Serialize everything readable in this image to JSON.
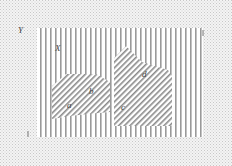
{
  "diagram": {
    "outer_label": "Y",
    "inner_label": "X",
    "region_labels": {
      "a": "a",
      "b": "b",
      "c": "c",
      "d": "d"
    },
    "tick_left": "1",
    "colors": {
      "background": "#ffffff",
      "dots": "#c8c8c8",
      "stripes": "#9a9a9a",
      "hatch": "#8a8a8a",
      "label": "#444444"
    }
  }
}
